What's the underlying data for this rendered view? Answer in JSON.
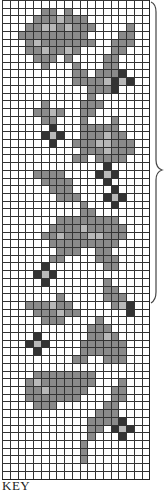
{
  "chart": {
    "columns": 19,
    "rows": 62,
    "legend_key_label": "KEY",
    "colors": {
      "0": "#ffffff",
      "1": "#8a8a8a",
      "2": "#b8b8b8",
      "3": "#333333"
    },
    "pattern": [
      "0000000000000000000",
      "0000011010000000000",
      "0000111211100000000",
      "0001122121110000100",
      "0011111111100001100",
      "0001211111110011100",
      "0001121121000011000",
      "0000111010000110000",
      "0000010001000110000",
      "0000000001101113000",
      "0000000001111232300",
      "0000000000011130000",
      "0000000000010000000",
      "0000010000111000000",
      "0000112100110000000",
      "0000011000100010000",
      "0000003000111110000",
      "0000032300111211000",
      "0000003001112211100",
      "0000000000111211100",
      "0000000001101111000",
      "0000000000000300000",
      "0000111100003230000",
      "0000011110000300000",
      "0000001110000030000",
      "0000000111000323000",
      "0000000000100030000",
      "0000000000110000000",
      "0000000111111110000",
      "0000001111211111000",
      "0000011211122111000",
      "0000001111111110000",
      "0000000111001100000",
      "0000001100001110000",
      "0000030000000110000",
      "0000323000000000000",
      "0000030000000100000",
      "0000000000000110000",
      "0000000100000111000",
      "0001112110000012300",
      "0000111211000000300",
      "0000011100001000000",
      "0000000000011100000",
      "0000300000011210000",
      "0003230000111111000",
      "0000300000111111000",
      "0000000001100111000",
      "0000000000000000000",
      "0000111111110000000",
      "0001211111110001000",
      "0001121111100011000",
      "0001111111000011000",
      "0000111000000110000",
      "0000000000001110000",
      "0000000000011113000",
      "0000000000011032300",
      "0000000000010003000",
      "0000000000100000000",
      "0000000000100000000",
      "0000000000100000000",
      "0000000000000000000",
      "0000000000000000000"
    ]
  }
}
